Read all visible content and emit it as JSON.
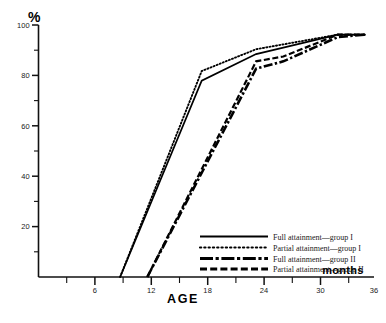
{
  "figure": {
    "background_color": "#ffffff",
    "ink_color": "#000000"
  },
  "chart_data": {
    "type": "line",
    "title": "",
    "subtitle": "",
    "xlabel": "AGE",
    "xunit_label": "months",
    "ylabel": "%",
    "xlim": [
      0,
      37
    ],
    "ylim": [
      0,
      104
    ],
    "grid": false,
    "legend_position": "inside-lower-right",
    "x_ticks_major": [
      6,
      12,
      18,
      24,
      30,
      36
    ],
    "x_ticks_minor": [
      3,
      9,
      15,
      21,
      27,
      33
    ],
    "x_ticklabels": [
      "6",
      "12",
      "18",
      "24",
      "30",
      "36"
    ],
    "y_ticks_major": [
      20,
      40,
      60,
      80,
      100
    ],
    "y_ticks_minor": [
      10,
      30,
      50,
      70,
      90
    ],
    "y_ticklabels": [
      "20",
      "40",
      "60",
      "80",
      "100"
    ],
    "series": [
      {
        "name": "Full attainment—group I",
        "style": "solid",
        "x": [
          9,
          18,
          24,
          33,
          36
        ],
        "values": [
          0,
          81,
          92,
          100,
          100
        ]
      },
      {
        "name": "Partial attainment—group I",
        "style": "dotted",
        "x": [
          9,
          18,
          24,
          33,
          36
        ],
        "values": [
          0,
          85,
          94,
          100,
          100
        ]
      },
      {
        "name": "Full attainment—group II",
        "style": "dash-dot",
        "x": [
          12,
          24,
          27,
          33,
          36
        ],
        "values": [
          0,
          86,
          89,
          99,
          100
        ]
      },
      {
        "name": "Partial attainment—group II",
        "style": "dashed",
        "x": [
          12,
          24,
          27,
          33,
          36
        ],
        "values": [
          0,
          89,
          91,
          100,
          100
        ]
      }
    ]
  },
  "legend": {
    "entries": [
      {
        "label": "Full attainment—group I"
      },
      {
        "label": "Partial attainment—group I"
      },
      {
        "label": "Full attainment—group II"
      },
      {
        "label": "Partial attainment—group II"
      }
    ]
  }
}
